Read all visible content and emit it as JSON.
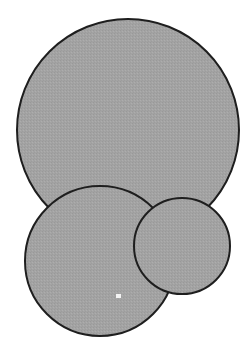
{
  "canvas": {
    "width": 248,
    "height": 359,
    "background": "#ffffff"
  },
  "style": {
    "fill": "#a3a3a3",
    "stroke": "#1e1e1e",
    "stroke_width": 2
  },
  "circles": [
    {
      "name": "large-circle",
      "cx": 128,
      "cy": 130,
      "r": 111
    },
    {
      "name": "bottom-left-circle",
      "cx": 100,
      "cy": 261,
      "r": 75
    },
    {
      "name": "bottom-right-circle",
      "cx": 182,
      "cy": 246,
      "r": 48
    }
  ],
  "marker": {
    "name": "white-dot",
    "x": 116,
    "y": 294,
    "w": 5,
    "h": 4,
    "color": "#f4f4f4"
  }
}
